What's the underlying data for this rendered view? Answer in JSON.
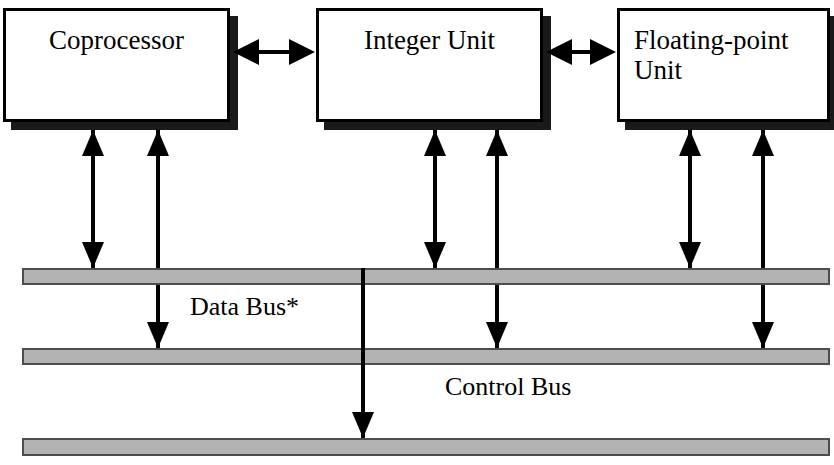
{
  "diagram": {
    "colors": {
      "bus_fill": "#b3b3b3",
      "bus_border": "#4d4d4d",
      "line": "#000000",
      "box_fill": "#ffffff",
      "shadow": "#1a1a1a"
    },
    "units": [
      {
        "id": "coprocessor",
        "label": "Coprocessor",
        "x": 3,
        "y": 8,
        "w": 227,
        "h": 114,
        "align": "centered"
      },
      {
        "id": "integer-unit",
        "label": "Integer Unit",
        "x": 316,
        "y": 8,
        "w": 227,
        "h": 114,
        "align": "centered"
      },
      {
        "id": "floating-point-unit",
        "label": "Floating-point Unit",
        "x": 617,
        "y": 8,
        "w": 213,
        "h": 114,
        "align": "left"
      }
    ],
    "buses": [
      {
        "id": "data-bus",
        "label": "Data Bus*",
        "label_x": 190,
        "label_y": 292,
        "x": 22,
        "y": 268,
        "w": 808,
        "h": 17
      },
      {
        "id": "control-bus",
        "label": "Control Bus",
        "label_x": 445,
        "label_y": 372,
        "x": 22,
        "y": 348,
        "w": 808,
        "h": 17
      },
      {
        "id": "third-bus",
        "label": "",
        "label_x": 0,
        "label_y": 0,
        "x": 22,
        "y": 438,
        "w": 808,
        "h": 18
      }
    ],
    "horizontal_connectors": [
      {
        "id": "coprocessor-to-integer-unit",
        "x": 233,
        "y": 52,
        "w": 82,
        "type": "double-headed"
      },
      {
        "id": "integer-unit-to-fpu",
        "x": 546,
        "y": 52,
        "w": 70,
        "type": "double-headed"
      }
    ],
    "vertical_connectors": [
      {
        "id": "coprocessor-data-bus-bidirectional",
        "x": 93,
        "top": 130,
        "bottom": 268,
        "head_top": "up",
        "head_bottom": "down"
      },
      {
        "id": "coprocessor-control-bus-up",
        "x": 158,
        "top": 130,
        "bottom": 348,
        "head_top": "up",
        "head_bottom": "down"
      },
      {
        "id": "integer-unit-data-bus-bidirectional",
        "x": 435,
        "top": 130,
        "bottom": 268,
        "head_top": "up",
        "head_bottom": "down"
      },
      {
        "id": "integer-unit-control-bus-up",
        "x": 497,
        "top": 130,
        "bottom": 348,
        "head_top": "up",
        "head_bottom": "down"
      },
      {
        "id": "fpu-data-bus-bidirectional",
        "x": 690,
        "top": 130,
        "bottom": 268,
        "head_top": "up",
        "head_bottom": "down"
      },
      {
        "id": "fpu-control-bus-up",
        "x": 763,
        "top": 130,
        "bottom": 348,
        "head_top": "up",
        "head_bottom": "down"
      },
      {
        "id": "control-bus-to-third-bus",
        "x": 363,
        "top": 268,
        "bottom": 438,
        "head_top": "none",
        "head_bottom": "down"
      }
    ]
  }
}
